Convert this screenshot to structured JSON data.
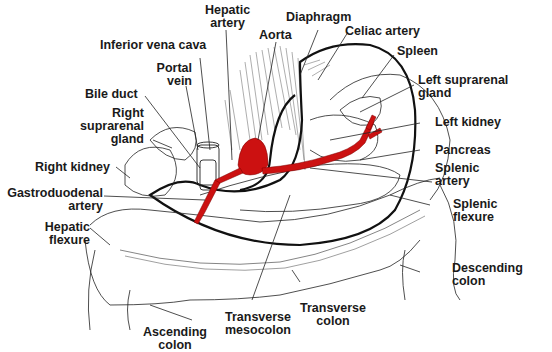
{
  "diagram": {
    "colors": {
      "artery": "#cc1111",
      "outline": "#111111",
      "leader": "#222222",
      "background": "#ffffff"
    },
    "labels": {
      "hepatic_artery": [
        "Hepatic",
        "artery"
      ],
      "diaphragm": "Diaphragm",
      "aorta": "Aorta",
      "celiac_artery": "Celiac artery",
      "inferior_vena_cava": "Inferior vena cava",
      "spleen": "Spleen",
      "portal_vein": [
        "Portal",
        "vein"
      ],
      "left_suprarenal_gland": [
        "Left suprarenal",
        "gland"
      ],
      "bile_duct": "Bile duct",
      "right_suprarenal_gland": [
        "Right",
        "suprarenal",
        "gland"
      ],
      "left_kidney": "Left kidney",
      "pancreas": "Pancreas",
      "right_kidney": "Right kidney",
      "splenic_artery": [
        "Splenic",
        "artery"
      ],
      "gastroduodenal_artery": [
        "Gastroduodenal",
        "artery"
      ],
      "splenic_flexure": [
        "Splenic",
        "flexure"
      ],
      "hepatic_flexure": [
        "Hepatic",
        "flexure"
      ],
      "descending_colon": [
        "Descending",
        "colon"
      ],
      "transverse_colon": [
        "Transverse",
        "colon"
      ],
      "transverse_mesocolon": [
        "Transverse",
        "mesocolon"
      ],
      "ascending_colon": [
        "Ascending",
        "colon"
      ]
    }
  }
}
